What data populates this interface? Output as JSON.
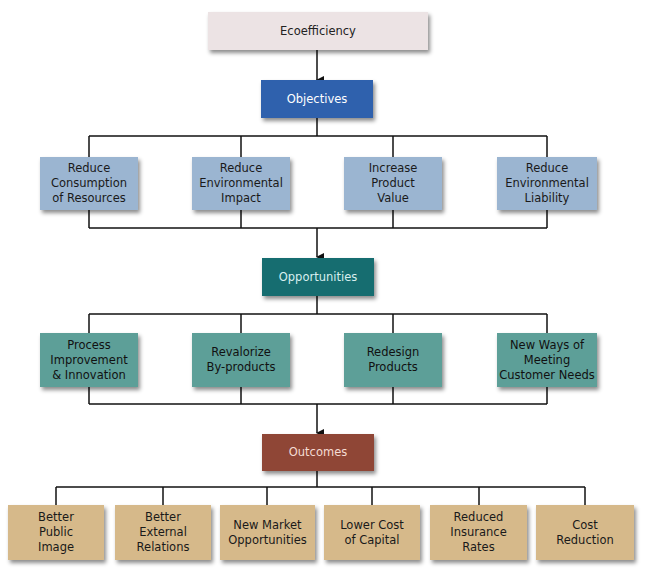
{
  "diagram": {
    "root": {
      "label": "Ecoefficiency"
    },
    "objectives": {
      "label": "Objectives",
      "items": [
        {
          "label": "Reduce\nConsumption\nof Resources"
        },
        {
          "label": "Reduce\nEnvironmental\nImpact"
        },
        {
          "label": "Increase\nProduct\nValue"
        },
        {
          "label": "Reduce\nEnvironmental\nLiability"
        }
      ]
    },
    "opportunities": {
      "label": "Opportunities",
      "items": [
        {
          "label": "Process\nImprovement\n& Innovation"
        },
        {
          "label": "Revalorize\nBy-products"
        },
        {
          "label": "Redesign\nProducts"
        },
        {
          "label": "New Ways of\nMeeting\nCustomer Needs"
        }
      ]
    },
    "outcomes": {
      "label": "Outcomes",
      "items": [
        {
          "label": "Better\nPublic\nImage"
        },
        {
          "label": "Better\nExternal\nRelations"
        },
        {
          "label": "New Market\nOpportunities"
        },
        {
          "label": "Lower Cost\nof Capital"
        },
        {
          "label": "Reduced\nInsurance\nRates"
        },
        {
          "label": "Cost\nReduction"
        }
      ]
    }
  },
  "colors": {
    "root": "#ece3e4",
    "objectives_head": "#2f61ad",
    "objectives_item": "#9bb5d1",
    "opportunities_head": "#166d70",
    "opportunities_item": "#5d9f98",
    "outcomes_head": "#8f4636",
    "outcomes_item": "#d6b98a"
  }
}
